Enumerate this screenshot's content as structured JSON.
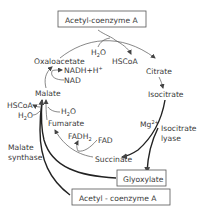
{
  "diagram": {
    "boxes": {
      "acetyl_coa_top": "Acetyl-coenzyme A",
      "glyoxylate": "Glyoxylate",
      "acetyl_coa_bottom": "Acetyl - coenzyme A"
    },
    "metabolites": {
      "oxaloacetate": "Oxaloacetate",
      "citrate": "Citrate",
      "isocitrate": "Isocitrate",
      "succinate": "Succinate",
      "fumarate": "Fumarate",
      "malate": "Malate"
    },
    "cofactors": {
      "h2o_top": "H",
      "h2o_top_sub": "2",
      "h2o_top_o": "O",
      "hscoa_top": "HSCoA",
      "nadh": "NADH+H",
      "nadh_sup": "+",
      "nad": "NAD",
      "hscoa_left": "HSCoA",
      "h2o_left": "H",
      "h2o_left_sub": "2",
      "h2o_left_o": "O",
      "h2o_fum": "H",
      "h2o_fum_sub": "2",
      "h2o_fum_o": "O",
      "fadh2": "FADH",
      "fadh2_sub": "2",
      "fad": "FAD",
      "mg": "Mg",
      "mg_sup": "2+"
    },
    "enzymes": {
      "isocitrate_lyase_1": "Isocitrate",
      "isocitrate_lyase_2": "lyase",
      "malate_synthase_1": "Malate",
      "malate_synthase_2": "synthase"
    },
    "colors": {
      "line": "#555555",
      "thick_line": "#222222",
      "text": "#3a3a3a"
    }
  }
}
